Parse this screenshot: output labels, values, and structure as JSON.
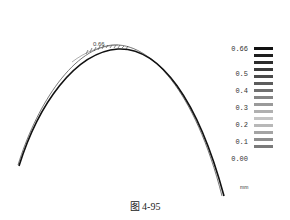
{
  "figure": {
    "caption": "图 4-95",
    "peak_label": "0.66",
    "unit": "mm"
  },
  "legend": {
    "labels": [
      {
        "text": "0.66",
        "y": 0
      },
      {
        "text": "0.5",
        "y": 25
      },
      {
        "text": "0.4",
        "y": 42
      },
      {
        "text": "0.3",
        "y": 59
      },
      {
        "text": "0.2",
        "y": 76
      },
      {
        "text": "0.1",
        "y": 93
      },
      {
        "text": "0.00",
        "y": 110
      }
    ],
    "bars": [
      {
        "color": "#111111"
      },
      {
        "color": "#1e1e1e"
      },
      {
        "color": "#2c2c2c"
      },
      {
        "color": "#3a3a3a"
      },
      {
        "color": "#4a4a4a"
      },
      {
        "color": "#5c5c5c"
      },
      {
        "color": "#707070"
      },
      {
        "color": "#858585"
      },
      {
        "color": "#9a9a9a"
      },
      {
        "color": "#b0b0b0"
      },
      {
        "color": "#c4c4c4"
      },
      {
        "color": "#b8b8b8"
      },
      {
        "color": "#a4a4a4"
      },
      {
        "color": "#8e8e8e"
      },
      {
        "color": "#7a7a7a"
      }
    ]
  }
}
